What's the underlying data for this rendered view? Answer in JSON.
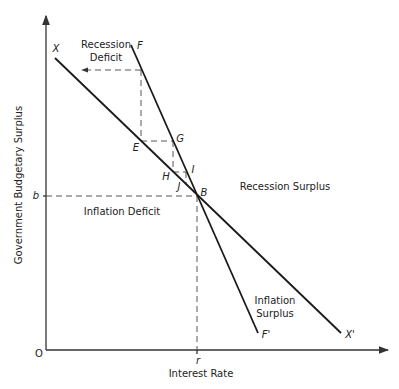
{
  "axes": {
    "y_label": "Government Budgetary Surplus",
    "x_label": "Interest Rate",
    "origin_label": "O",
    "y_tick_label": "b",
    "x_tick_label": "r"
  },
  "lines": [
    {
      "name": "X line",
      "start_label": "X",
      "end_label": "X'"
    },
    {
      "name": "F line",
      "start_label": "F",
      "end_label": "F'"
    }
  ],
  "points": {
    "E": "E",
    "G": "G",
    "H": "H",
    "I": "I",
    "J": "J",
    "B": "B"
  },
  "regions": {
    "recession_deficit_line1": "Recession",
    "recession_deficit_line2": "Deficit",
    "recession_surplus": "Recession Surplus",
    "inflation_deficit": "Inflation Deficit",
    "inflation_surplus_line1": "Inflation",
    "inflation_surplus_line2": "Surplus"
  }
}
